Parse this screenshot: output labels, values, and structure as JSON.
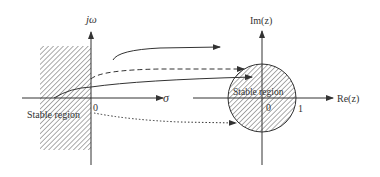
{
  "left_plane": {
    "vertical_axis_label": "jω",
    "horizontal_axis_label": "σ",
    "origin_label": "0",
    "region_label": "Stable region"
  },
  "right_plane": {
    "vertical_axis_label": "Im(z)",
    "horizontal_axis_label": "Re(z)",
    "origin_label": "0",
    "unit_label": "1",
    "region_label": "Stable region"
  },
  "colors": {
    "line": "#333333",
    "hatch": "#555555",
    "background": "#ffffff"
  }
}
